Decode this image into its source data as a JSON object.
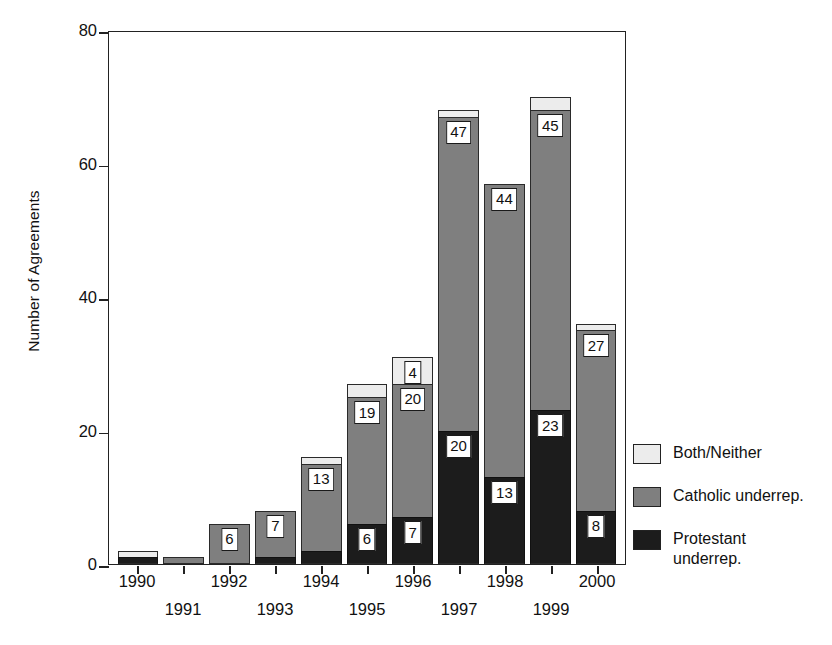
{
  "chart_data": {
    "type": "bar",
    "stacked": true,
    "title": "",
    "xlabel": "",
    "ylabel": "Number of Agreements",
    "ylim": [
      0,
      80
    ],
    "yticks": [
      0,
      20,
      40,
      60,
      80
    ],
    "grid": false,
    "legend_position": "right",
    "categories": [
      "1990",
      "1991",
      "1992",
      "1993",
      "1994",
      "1995",
      "1996",
      "1997",
      "1998",
      "1999",
      "2000"
    ],
    "series": [
      {
        "name": "Protestant underrep.",
        "color": "#1c1c1c",
        "values": [
          1,
          0,
          0,
          1,
          2,
          6,
          7,
          20,
          13,
          23,
          8
        ],
        "labels": [
          "",
          "",
          "",
          "",
          "",
          "6",
          "7",
          "20",
          "13",
          "23",
          "8"
        ]
      },
      {
        "name": "Catholic underrep.",
        "color": "#7f7f7f",
        "values": [
          0,
          1,
          6,
          7,
          13,
          19,
          20,
          47,
          44,
          45,
          27
        ],
        "labels": [
          "",
          "",
          "6",
          "7",
          "13",
          "19",
          "20",
          "47",
          "44",
          "45",
          "27"
        ]
      },
      {
        "name": "Both/Neither",
        "color": "#ececec",
        "values": [
          1,
          0,
          0,
          0,
          1,
          2,
          4,
          1,
          0,
          2,
          1
        ],
        "labels": [
          "",
          "",
          "",
          "",
          "",
          "",
          "4",
          "",
          "",
          "",
          ""
        ]
      }
    ],
    "totals": [
      2,
      1,
      6,
      8,
      16,
      27,
      31,
      68,
      57,
      70,
      36
    ]
  },
  "axis": {
    "y_label": "Number of Agreements",
    "y_ticks": [
      "0",
      "20",
      "40",
      "60",
      "80"
    ],
    "x_ticks_top_row": [
      "1990",
      "1992",
      "1994",
      "1996",
      "1998",
      "2000"
    ],
    "x_ticks_bottom_row": [
      "1991",
      "1993",
      "1995",
      "1997",
      "1999"
    ]
  },
  "legend": {
    "items": [
      {
        "swatch": "light",
        "label": "Both/Neither"
      },
      {
        "swatch": "gray",
        "label": "Catholic underrep."
      },
      {
        "swatch": "black",
        "label": "Protestant\nunderrep."
      }
    ]
  },
  "colors": {
    "both_neither": "#ececec",
    "catholic": "#7f7f7f",
    "protestant": "#1c1c1c",
    "axis": "#222222",
    "background": "#ffffff"
  }
}
